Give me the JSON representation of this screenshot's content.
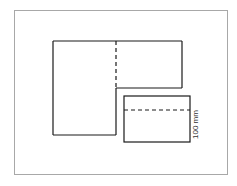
{
  "diagram": {
    "type": "net/pattern layout",
    "shapes": [
      {
        "id": "left-panel",
        "kind": "rectangle",
        "fold_line": "right edge dashed (upper section)"
      },
      {
        "id": "top-right-panel",
        "kind": "rectangle"
      },
      {
        "id": "bottom-right-panel",
        "kind": "rectangle",
        "fold_line": "horizontal dashed"
      }
    ],
    "dimension_label": "100 mm",
    "colors": {
      "line": "#1a1a1a",
      "frame": "#a8a8a8",
      "background": "#ffffff"
    }
  }
}
